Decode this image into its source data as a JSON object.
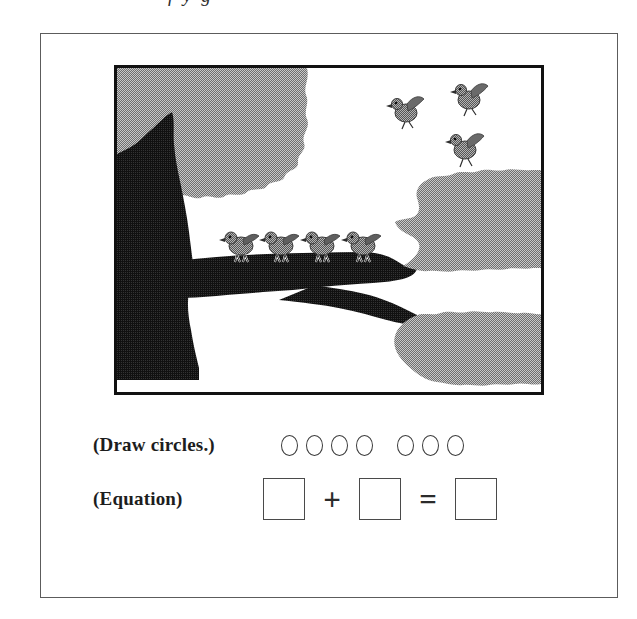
{
  "page": {
    "clipped_header_text": "f y g"
  },
  "worksheet": {
    "picture": {
      "alt_name": "birds-in-tree-illustration",
      "colors": {
        "foliage_gray": "#9a9a9a",
        "trunk_dark": "#1b1b1b",
        "frame_border": "#111111",
        "background": "#ffffff"
      },
      "scene": {
        "birds_perched_on_branch": 4,
        "birds_flying": 3,
        "total_birds": 7
      }
    },
    "rows": [
      {
        "label": "(Draw circles.)",
        "groups": [
          {
            "count": 4
          },
          {
            "count": 3
          }
        ]
      },
      {
        "label": "(Equation)",
        "operator_plus": "+",
        "operator_equals": "=",
        "boxes": [
          "",
          "",
          ""
        ]
      }
    ]
  }
}
